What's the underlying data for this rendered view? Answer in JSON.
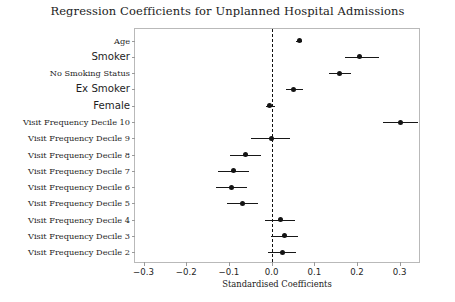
{
  "chart_data": {
    "type": "scatter",
    "title": "Regression Coefficients for Unplanned Hospital Admissions",
    "xlabel": "Standardised Coefficients",
    "ylabel": "",
    "xlim": [
      -0.32,
      0.35
    ],
    "xticks": [
      -0.3,
      -0.2,
      -0.1,
      0.0,
      0.1,
      0.2,
      0.3
    ],
    "xticklabels": [
      "−0.3",
      "−0.2",
      "−0.1",
      "0.0",
      "0.1",
      "0.2",
      "0.3"
    ],
    "grid": false,
    "legend": "none",
    "reference_line": 0.0,
    "reference_line_style": "dashed",
    "categories": [
      "Age",
      "Smoker",
      "No Smoking Status",
      "Ex Smoker",
      "Female",
      "Visit Frequency Decile 10",
      "Visit Frequency Decile 9",
      "Visit Frequency Decile 8",
      "Visit Frequency Decile 7",
      "Visit Frequency Decile 6",
      "Visit Frequency Decile 5",
      "Visit Frequency Decile 4",
      "Visit Frequency Decile 3",
      "Visit Frequency Decile 2"
    ],
    "label_styles": [
      "serif",
      "sans",
      "serif",
      "sans",
      "sans",
      "serif",
      "serif",
      "serif",
      "serif",
      "serif",
      "serif",
      "serif",
      "serif",
      "serif"
    ],
    "points": [
      {
        "label": "Age",
        "value": 0.065,
        "ci_low": 0.058,
        "ci_high": 0.072
      },
      {
        "label": "Smoker",
        "value": 0.207,
        "ci_low": 0.173,
        "ci_high": 0.252
      },
      {
        "label": "No Smoking Status",
        "value": 0.159,
        "ci_low": 0.134,
        "ci_high": 0.186
      },
      {
        "label": "Ex Smoker",
        "value": 0.052,
        "ci_low": 0.033,
        "ci_high": 0.074
      },
      {
        "label": "Female",
        "value": -0.004,
        "ci_low": -0.014,
        "ci_high": 0.008
      },
      {
        "label": "Visit Frequency Decile 10",
        "value": 0.302,
        "ci_low": 0.262,
        "ci_high": 0.343
      },
      {
        "label": "Visit Frequency Decile 9",
        "value": -0.001,
        "ci_low": -0.048,
        "ci_high": 0.044
      },
      {
        "label": "Visit Frequency Decile 8",
        "value": -0.06,
        "ci_low": -0.097,
        "ci_high": -0.024
      },
      {
        "label": "Visit Frequency Decile 7",
        "value": -0.089,
        "ci_low": -0.126,
        "ci_high": -0.053
      },
      {
        "label": "Visit Frequency Decile 6",
        "value": -0.094,
        "ci_low": -0.13,
        "ci_high": -0.058
      },
      {
        "label": "Visit Frequency Decile 5",
        "value": -0.068,
        "ci_low": -0.104,
        "ci_high": -0.032
      },
      {
        "label": "Visit Frequency Decile 4",
        "value": 0.02,
        "ci_low": -0.015,
        "ci_high": 0.054
      },
      {
        "label": "Visit Frequency Decile 3",
        "value": 0.03,
        "ci_low": -0.002,
        "ci_high": 0.063
      },
      {
        "label": "Visit Frequency Decile 2",
        "value": 0.025,
        "ci_low": -0.008,
        "ci_high": 0.058
      }
    ]
  },
  "colors": {
    "marker": "#141414",
    "line": "#171717",
    "axis": "#b9b9b9",
    "reference": "#111111",
    "background": "#ffffff"
  }
}
